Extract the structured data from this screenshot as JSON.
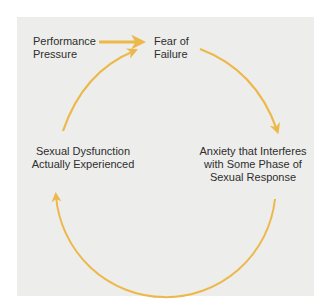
{
  "diagram": {
    "nodes": {
      "performance_pressure": {
        "line1": "Performance",
        "line2": "Pressure"
      },
      "fear_of_failure": {
        "line1": "Fear of",
        "line2": "Failure"
      },
      "anxiety": {
        "line1": "Anxiety that Interferes",
        "line2": "with Some Phase of",
        "line3": "Sexual Response"
      },
      "dysfunction": {
        "line1": "Sexual Dysfunction",
        "line2": "Actually Experienced"
      }
    },
    "edges": [
      {
        "from": "Performance Pressure",
        "to": "Fear of Failure"
      },
      {
        "from": "Fear of Failure",
        "to": "Anxiety that Interferes with Some Phase of Sexual Response"
      },
      {
        "from": "Anxiety that Interferes with Some Phase of Sexual Response",
        "to": "Sexual Dysfunction Actually Experienced"
      },
      {
        "from": "Sexual Dysfunction Actually Experienced",
        "to": "Fear of Failure"
      }
    ],
    "colors": {
      "arrow": "#EDB84A",
      "background": "#EDEDEB",
      "text": "#2E2E2E"
    }
  }
}
